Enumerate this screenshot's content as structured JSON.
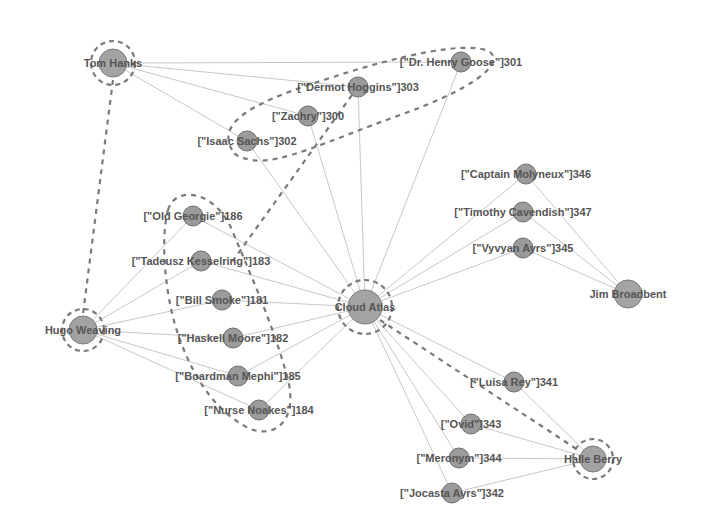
{
  "colors": {
    "background": "#ffffff",
    "node_fill": "#9b9b9b",
    "edge": "#c8c8c8",
    "dashed": "#7a7a7a",
    "label": "#555555"
  },
  "nodes": {
    "tom_hanks": {
      "label": "Tom Hanks",
      "x": 113,
      "y": 63,
      "r": 14,
      "ring": true
    },
    "hugo_weaving": {
      "label": "Hugo Weaving",
      "x": 83,
      "y": 330,
      "r": 14,
      "ring": true
    },
    "cloud_atlas": {
      "label": "Cloud Atlas",
      "x": 365,
      "y": 307,
      "r": 17,
      "ring": true
    },
    "jim_broadbent": {
      "label": "Jim Broadbent",
      "x": 628,
      "y": 294,
      "r": 14,
      "ring": false
    },
    "halle_berry": {
      "label": "Halle Berry",
      "x": 593,
      "y": 459,
      "r": 13,
      "ring": true
    },
    "dr_henry_goose": {
      "label": "[\"Dr. Henry Goose\"]301",
      "x": 461,
      "y": 62,
      "r": 10
    },
    "dermot_hoggins": {
      "label": "[\"Dermot Hoggins\"]303",
      "x": 358,
      "y": 87,
      "r": 10
    },
    "zachry": {
      "label": "[\"Zachry\"]300",
      "x": 308,
      "y": 116,
      "r": 10
    },
    "isaac_sachs": {
      "label": "[\"Isaac Sachs\"]302",
      "x": 247,
      "y": 141,
      "r": 10
    },
    "old_georgie": {
      "label": "[\"Old Georgie\"]186",
      "x": 193,
      "y": 216,
      "r": 10
    },
    "tadeusz": {
      "label": "[\"Tadeusz Kesselring\"]183",
      "x": 201,
      "y": 261,
      "r": 10
    },
    "bill_smoke": {
      "label": "[\"Bill Smoke\"]181",
      "x": 222,
      "y": 300,
      "r": 10
    },
    "haskell_moore": {
      "label": "[\"Haskell Moore\"]182",
      "x": 233,
      "y": 338,
      "r": 10
    },
    "boardman_mephi": {
      "label": "[\"Boardman Mephi\"]185",
      "x": 238,
      "y": 376,
      "r": 10
    },
    "nurse_noakes": {
      "label": "[\"Nurse Noakes\"]184",
      "x": 259,
      "y": 410,
      "r": 10
    },
    "captain_molyneux": {
      "label": "[\"Captain Molyneux\"]346",
      "x": 526,
      "y": 174,
      "r": 10
    },
    "timothy_cavendish": {
      "label": "[\"Timothy Cavendish\"]347",
      "x": 523,
      "y": 212,
      "r": 10
    },
    "vyvyan_ayrs": {
      "label": "[\"Vyvyan Ayrs\"]345",
      "x": 523,
      "y": 248,
      "r": 10
    },
    "luisa_rey": {
      "label": "[\"Luisa Rey\"]341",
      "x": 514,
      "y": 382,
      "r": 10
    },
    "ovid": {
      "label": "[\"Ovid\"]343",
      "x": 471,
      "y": 424,
      "r": 10
    },
    "meronym": {
      "label": "[\"Meronym\"]344",
      "x": 459,
      "y": 458,
      "r": 10
    },
    "jocasta_ayrs": {
      "label": "[\"Jocasta Ayrs\"]342",
      "x": 452,
      "y": 493,
      "r": 10
    }
  }
}
